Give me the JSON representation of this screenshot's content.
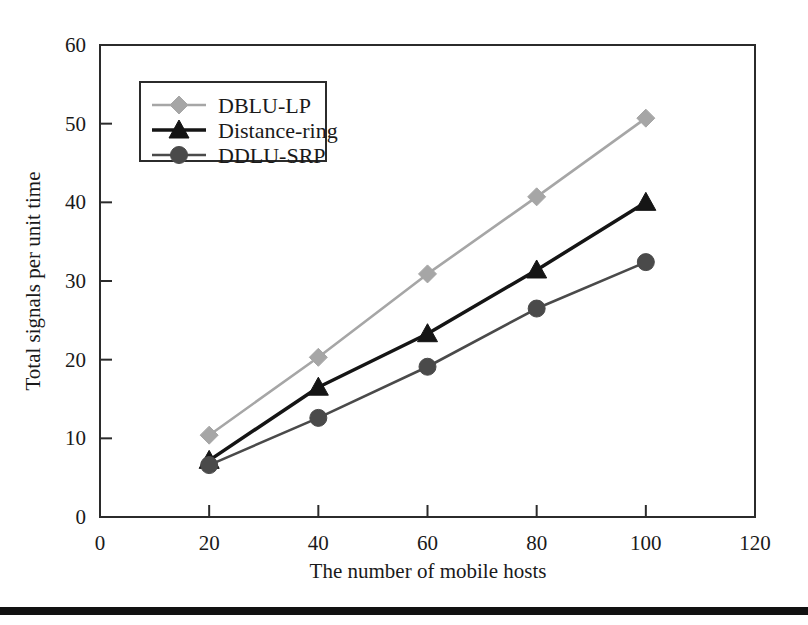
{
  "chart_data": {
    "type": "line",
    "title": "",
    "xlabel": "The number of mobile hosts",
    "ylabel": "Total signals per unit time",
    "x": [
      20,
      40,
      60,
      80,
      100
    ],
    "xlim": [
      0,
      120
    ],
    "ylim": [
      0,
      60
    ],
    "xticks": [
      0,
      20,
      40,
      60,
      80,
      100,
      120
    ],
    "yticks": [
      0,
      10,
      20,
      30,
      40,
      50,
      60
    ],
    "xtick_labels": [
      "0",
      "20",
      "40",
      "60",
      "80",
      "100",
      "120"
    ],
    "ytick_labels": [
      "0",
      "10",
      "20",
      "30",
      "40",
      "50",
      "60"
    ],
    "grid": false,
    "legend_position": "upper-left-inside",
    "series": [
      {
        "name": "DBLU-LP",
        "values": [
          10.4,
          20.3,
          30.9,
          40.7,
          50.7
        ],
        "color": "#a6a6a6",
        "marker": "diamond"
      },
      {
        "name": "Distance-ring",
        "values": [
          7.2,
          16.5,
          23.3,
          31.4,
          40.0
        ],
        "color": "#151515",
        "marker": "triangle"
      },
      {
        "name": "DDLU-SRP",
        "values": [
          6.6,
          12.6,
          19.1,
          26.5,
          32.4
        ],
        "color": "#4a4a4a",
        "marker": "circle"
      }
    ]
  },
  "legend": {
    "entries": [
      {
        "label": "DBLU-LP"
      },
      {
        "label": "Distance-ring"
      },
      {
        "label": "DDLU-SRP"
      }
    ]
  },
  "axes": {
    "x_title": "The number of mobile hosts",
    "y_title": "Total signals per unit time"
  }
}
